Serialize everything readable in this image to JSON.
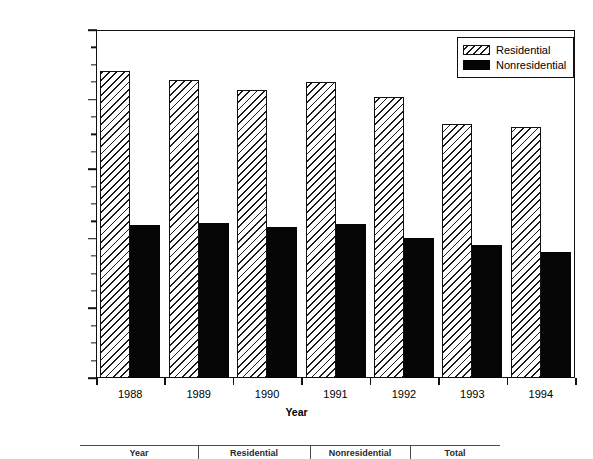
{
  "chart_data": {
    "type": "bar",
    "title": "",
    "xlabel": "Year",
    "ylabel": "Reported Burglaries",
    "categories": [
      "1988",
      "1989",
      "1990",
      "1991",
      "1992",
      "1993",
      "1994"
    ],
    "series": [
      {
        "name": "Residential",
        "values": [
          2205000,
          2140000,
          2070000,
          2125000,
          2020000,
          1825000,
          1805000
        ]
      },
      {
        "name": "Nonresidential",
        "values": [
          1100000,
          1115000,
          1085000,
          1105000,
          1005000,
          955000,
          905000
        ]
      }
    ],
    "ylim": [
      0,
      2500000
    ],
    "ytick_values": [
      0,
      500000,
      1000000,
      1500000,
      2000000,
      2500000
    ],
    "ytick_labels": [
      "0",
      "500,000",
      "1,000,000",
      "1,500,000",
      "2,000,000",
      "2,500,000"
    ],
    "yminor_tick_interval": 125000,
    "grid": false,
    "legend_position": "top-right",
    "colors": {
      "residential_fill": "#ffffff",
      "residential_hatch": "#1a1a1a",
      "nonresidential_fill": "#050505",
      "axis": "#111111"
    }
  },
  "legend": {
    "entries": [
      {
        "label": "Residential",
        "swatch": "hatched"
      },
      {
        "label": "Nonresidential",
        "swatch": "solid-black"
      }
    ]
  },
  "table_fragment": {
    "headers": [
      "Year",
      "Residential",
      "Nonresidential",
      "Total"
    ]
  }
}
